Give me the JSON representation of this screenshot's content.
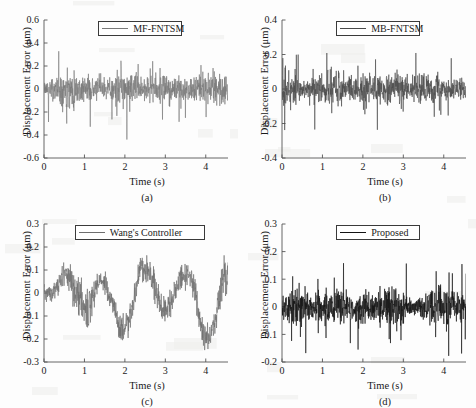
{
  "figure": {
    "width": 476,
    "height": 408,
    "background": "#fdfdfd",
    "panel_count": 4
  },
  "chart_data": [
    {
      "id": "a",
      "type": "line",
      "title": "",
      "subcaption": "(a)",
      "legend": "MF-FNTSM",
      "legend_position": "top-center",
      "color": "#7a7a7a",
      "xlabel": "Time (s)",
      "ylabel": "Displacement Error (μm)",
      "xlim": [
        0,
        4.55
      ],
      "ylim": [
        -0.6,
        0.6
      ],
      "xticks": [
        0,
        1,
        2,
        3,
        4
      ],
      "yticks": [
        0.6,
        0.4,
        0.2,
        0,
        -0.2,
        -0.4,
        -0.6
      ],
      "xticklabels": [
        "0",
        "1",
        "2",
        "3",
        "4"
      ],
      "yticklabels": [
        "0.6",
        "0.4",
        "0.2",
        "0",
        "-0.2",
        "-0.4",
        "-0.6"
      ],
      "grid": false,
      "series_description": "Dense random displacement error noise, band roughly ±0.15 μm with intermittent spikes to +0.41 and -0.49 μm",
      "noise_band": 0.085,
      "spike_scale": 0.3,
      "seed": 11,
      "samples": 900
    },
    {
      "id": "b",
      "type": "line",
      "title": "",
      "subcaption": "(b)",
      "legend": "MB-FNTSM",
      "legend_position": "top-center",
      "color": "#4a4a4a",
      "xlabel": "Time (s)",
      "ylabel": "Displacement Error (μm)",
      "xlim": [
        0,
        4.55
      ],
      "ylim": [
        -0.4,
        0.4
      ],
      "xticks": [
        0,
        1,
        2,
        3,
        4
      ],
      "yticks": [
        0.4,
        0.2,
        0,
        -0.2,
        -0.4
      ],
      "xticklabels": [
        "0",
        "1",
        "2",
        "3",
        "4"
      ],
      "yticklabels": [
        "0.4",
        "0.2",
        "0",
        "-0.2",
        "-0.4"
      ],
      "grid": false,
      "series_description": "Dense random displacement error noise, band roughly ±0.07 μm with spikes to +0.30 and -0.29 μm",
      "noise_band": 0.062,
      "spike_scale": 0.22,
      "seed": 27,
      "samples": 900
    },
    {
      "id": "c",
      "type": "line",
      "title": "",
      "subcaption": "(c)",
      "legend": "Wang's Controller",
      "legend_position": "top-center",
      "color": "#6e6e6e",
      "xlabel": "Time (s)",
      "ylabel": "Displacement Error (μm)",
      "xlim": [
        0,
        4.55
      ],
      "ylim": [
        -0.3,
        0.3
      ],
      "xticks": [
        0,
        1,
        2,
        3,
        4
      ],
      "yticks": [
        0.3,
        0.2,
        0.1,
        0,
        -0.1,
        -0.2,
        -0.3
      ],
      "xticklabels": [
        "0",
        "1",
        "2",
        "3",
        "4"
      ],
      "yticklabels": [
        "0.3",
        "0.2",
        "0.1",
        "0",
        "-0.1",
        "-0.2",
        "-0.3"
      ],
      "grid": false,
      "series_description": "Low-frequency oscillating drift with superposed noise; excursions to +0.24 near t=1.6, 2.6, 3.6 s and to -0.28 near t=2.15, 3.1 s",
      "noise_band": 0.048,
      "drift_amplitude": 0.15,
      "seed": 41,
      "samples": 900
    },
    {
      "id": "d",
      "type": "line",
      "title": "",
      "subcaption": "(d)",
      "legend": "Proposed",
      "legend_position": "top-center",
      "color": "#141414",
      "xlabel": "Time (s)",
      "ylabel": "Displacement Error (μm)",
      "xlim": [
        0,
        4.55
      ],
      "ylim": [
        -0.2,
        0.3
      ],
      "xticks": [
        0,
        1,
        2,
        3,
        4
      ],
      "yticks": [
        0.3,
        0.2,
        0.1,
        0,
        -0.1,
        -0.2
      ],
      "xticklabels": [
        "0",
        "1",
        "2",
        "3",
        "4"
      ],
      "yticklabels": [
        "0.3",
        "0.2",
        "0.1",
        "0",
        "-0.1",
        "-0.2"
      ],
      "grid": false,
      "series_description": "Tight dense noise about zero, band roughly ±0.045 μm with spikes to +0.20 and -0.17 μm",
      "noise_band": 0.042,
      "spike_scale": 0.14,
      "seed": 63,
      "samples": 1000
    }
  ]
}
